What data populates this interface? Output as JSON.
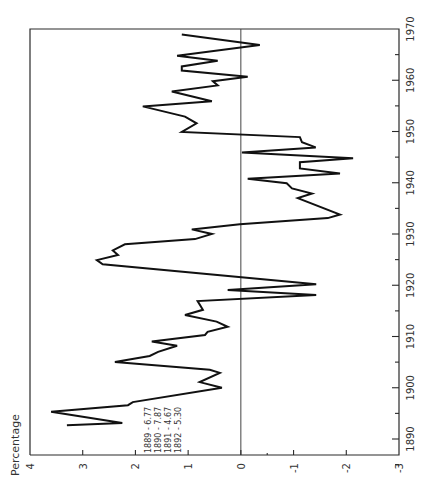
{
  "chart_data": {
    "type": "line",
    "orientation": "rotated-90-ccw",
    "title": "",
    "xlabel": "",
    "ylabel": "Percentage",
    "xlim": [
      1887,
      1970
    ],
    "ylim": [
      -3,
      4
    ],
    "x_ticks": [
      1890,
      1900,
      1910,
      1920,
      1930,
      1940,
      1950,
      1960,
      1970
    ],
    "x_tick_labels": [
      "1890",
      "1900",
      "1910",
      "1920",
      "1930",
      "1940",
      "1950",
      "1960",
      "1970"
    ],
    "y_ticks": [
      4,
      3,
      2,
      1,
      0,
      -1,
      -2,
      -3
    ],
    "y_tick_labels": [
      "4",
      "3",
      "2",
      "1",
      "0",
      "-1",
      "-2",
      "-3"
    ],
    "zero_line": true,
    "grid": false,
    "annotations": [
      "1889 - 6.77",
      "1890 - 7.87",
      "1891 - 4.67",
      "1892 - 5.30"
    ],
    "x": [
      1892.7,
      1893.1,
      1895.3,
      1896.6,
      1897.2,
      1900.0,
      1901.1,
      1902.9,
      1903.5,
      1905.0,
      1906.2,
      1907.0,
      1908.2,
      1909.0,
      1910.3,
      1910.9,
      1911.9,
      1912.9,
      1914.2,
      1915.2,
      1916.9,
      1918.1,
      1919.1,
      1920.2,
      1924.1,
      1924.9,
      1925.9,
      1926.8,
      1928.0,
      1929.0,
      1930.0,
      1930.9,
      1931.9,
      1933.1,
      1933.8,
      1937.0,
      1937.9,
      1938.9,
      1939.9,
      1940.8,
      1941.8,
      1942.8,
      1944.0,
      1944.8,
      1945.9,
      1946.9,
      1947.9,
      1948.9,
      1949.9,
      1951.6,
      1952.9,
      1954.9,
      1955.9,
      1957.8,
      1959.0,
      1959.8,
      1960.7,
      1961.9,
      1962.7,
      1963.8,
      1964.8,
      1966.9,
      1968.9
    ],
    "values": [
      3.3,
      2.25,
      3.6,
      2.14,
      2.05,
      0.36,
      0.78,
      0.4,
      0.59,
      2.39,
      1.73,
      1.57,
      1.21,
      1.69,
      0.68,
      0.63,
      0.25,
      0.46,
      1.06,
      0.72,
      0.82,
      -1.43,
      0.25,
      -1.43,
      2.62,
      2.73,
      2.33,
      2.43,
      2.2,
      0.87,
      0.55,
      0.93,
      0.02,
      -1.65,
      -1.88,
      -1.08,
      -1.35,
      -0.97,
      -0.87,
      -0.13,
      -1.88,
      -1.12,
      -1.12,
      -2.13,
      -0.02,
      -1.42,
      -1.16,
      -1.12,
      1.12,
      0.84,
      1.06,
      1.86,
      0.55,
      1.31,
      0.44,
      0.53,
      -0.13,
      1.12,
      1.12,
      0.44,
      1.21,
      -0.36,
      1.12
    ],
    "legend": null
  },
  "layout": {
    "value_to_px": {
      "v0": 4,
      "px0": 30,
      "v1": -3,
      "px1": 399
    },
    "year_to_px": {
      "y0": 1890,
      "px0": 439,
      "y1": 1970,
      "px1": 29
    },
    "frame": {
      "left": 30,
      "top": 29,
      "right": 399,
      "bottom": 455
    }
  }
}
